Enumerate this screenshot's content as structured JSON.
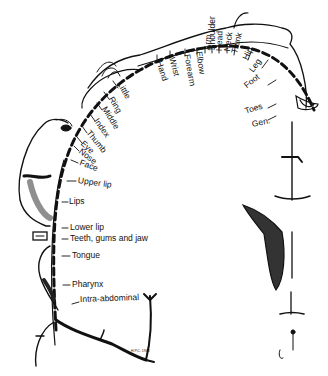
{
  "diagram": {
    "type": "cortical-homunculus",
    "background": "#ffffff",
    "ink": "#111111",
    "labels": [
      {
        "id": "little",
        "text": "Little",
        "x": 120,
        "y": 83,
        "rot": 62
      },
      {
        "id": "ring",
        "text": "Ring",
        "x": 111,
        "y": 98,
        "rot": 60
      },
      {
        "id": "middle",
        "text": "Middle",
        "x": 104,
        "y": 108,
        "rot": 58
      },
      {
        "id": "index",
        "text": "Index",
        "x": 96,
        "y": 120,
        "rot": 55
      },
      {
        "id": "thumb",
        "text": "Thumb",
        "x": 88,
        "y": 132,
        "rot": 50
      },
      {
        "id": "eye",
        "text": "Eye",
        "x": 82,
        "y": 143,
        "rot": 42
      },
      {
        "id": "nose",
        "text": "Nose",
        "x": 80,
        "y": 151,
        "rot": 38
      },
      {
        "id": "face",
        "text": "Face",
        "x": 80,
        "y": 163,
        "rot": 20
      },
      {
        "id": "upper-lip",
        "text": "Upper lip",
        "x": 78,
        "y": 181,
        "rot": 8
      },
      {
        "id": "lips",
        "text": "Lips",
        "x": 69,
        "y": 202,
        "rot": 0
      },
      {
        "id": "lower-lip",
        "text": "Lower lip",
        "x": 70,
        "y": 228,
        "rot": 0
      },
      {
        "id": "teeth-gums-jaw",
        "text": "Teeth, gums and jaw",
        "x": 70,
        "y": 239,
        "rot": 0
      },
      {
        "id": "tongue",
        "text": "Tongue",
        "x": 72,
        "y": 256,
        "rot": 0
      },
      {
        "id": "pharynx",
        "text": "Pharynx",
        "x": 72,
        "y": 285,
        "rot": 0
      },
      {
        "id": "intra-abdominal",
        "text": "Intra-abdominal",
        "x": 80,
        "y": 300,
        "rot": -2
      },
      {
        "id": "hand",
        "text": "Hand",
        "x": 159,
        "y": 62,
        "rot": 72
      },
      {
        "id": "wrist",
        "text": "Wrist",
        "x": 172,
        "y": 58,
        "rot": 76
      },
      {
        "id": "forearm",
        "text": "Forearm",
        "x": 187,
        "y": 55,
        "rot": 80
      },
      {
        "id": "elbow",
        "text": "Elbow",
        "x": 199,
        "y": 52,
        "rot": 82
      },
      {
        "id": "arm",
        "text": "Arm",
        "x": 207,
        "y": 51,
        "rot": -85
      },
      {
        "id": "shoulder",
        "text": "Shoulder",
        "x": 212,
        "y": 51,
        "rot": -90
      },
      {
        "id": "head",
        "text": "Head",
        "x": 219,
        "y": 52,
        "rot": -88
      },
      {
        "id": "neck",
        "text": "Neck",
        "x": 227,
        "y": 52,
        "rot": -82
      },
      {
        "id": "trunk",
        "text": "Trunk",
        "x": 234,
        "y": 54,
        "rot": -75
      },
      {
        "id": "hip",
        "text": "Hip",
        "x": 245,
        "y": 60,
        "rot": -65
      },
      {
        "id": "leg",
        "text": "Leg",
        "x": 251,
        "y": 72,
        "rot": -55
      },
      {
        "id": "foot",
        "text": "Foot",
        "x": 245,
        "y": 87,
        "rot": -38
      },
      {
        "id": "toes",
        "text": "Toes",
        "x": 245,
        "y": 112,
        "rot": -18
      },
      {
        "id": "gen",
        "text": "Gen.",
        "x": 252,
        "y": 125,
        "rot": -12
      }
    ],
    "signature": "H.P.C. 1948"
  }
}
